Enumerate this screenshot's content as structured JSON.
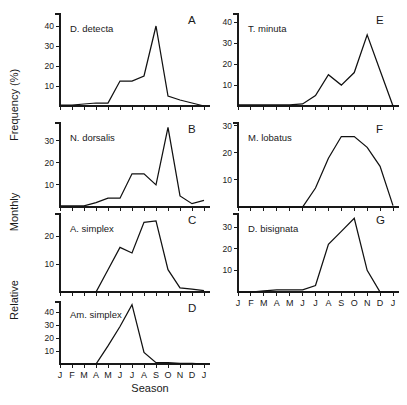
{
  "figure": {
    "xlabel": "Season",
    "ylabel": "Relative Monthly Frequency (%)",
    "ylabel_words": [
      "Relative",
      "Monthly",
      "Frequency (%)"
    ],
    "months": [
      "J",
      "F",
      "M",
      "A",
      "M",
      "J",
      "J",
      "A",
      "S",
      "O",
      "N",
      "D",
      "J"
    ],
    "month_axis_shown_on": [
      "D",
      "G"
    ]
  },
  "chart_data": [
    {
      "type": "line",
      "panel": "A",
      "title": "D. detecta",
      "xlabel": "",
      "ylabel": "",
      "categories": [
        "J",
        "F",
        "M",
        "A",
        "M",
        "J",
        "J",
        "A",
        "S",
        "O",
        "N",
        "D",
        "J"
      ],
      "values": [
        0.5,
        0.5,
        1,
        1.5,
        1.5,
        12.5,
        12.5,
        15,
        40,
        5,
        3,
        1.5,
        0
      ],
      "yticks": [
        10,
        20,
        30,
        40
      ],
      "ylim": [
        0,
        46
      ],
      "grid": false,
      "legend": false
    },
    {
      "type": "line",
      "panel": "B",
      "title": "N. dorsalis",
      "xlabel": "",
      "ylabel": "",
      "categories": [
        "J",
        "F",
        "M",
        "A",
        "M",
        "J",
        "J",
        "A",
        "S",
        "O",
        "N",
        "D",
        "J"
      ],
      "values": [
        0.5,
        0.5,
        0.5,
        2,
        4,
        4,
        15,
        15,
        10,
        36,
        5,
        1.5,
        3
      ],
      "yticks": [
        10,
        20,
        30
      ],
      "ylim": [
        0,
        38
      ],
      "grid": false,
      "legend": false
    },
    {
      "type": "line",
      "panel": "C",
      "title": "A. simplex",
      "xlabel": "",
      "ylabel": "",
      "categories": [
        "J",
        "F",
        "M",
        "A",
        "M",
        "J",
        "J",
        "A",
        "S",
        "O",
        "N",
        "D",
        "J"
      ],
      "values": [
        0,
        0,
        0,
        0,
        8,
        16,
        14,
        25,
        25.5,
        8,
        1.5,
        1,
        0.5
      ],
      "yticks": [
        10,
        20
      ],
      "ylim": [
        0,
        28
      ],
      "grid": false,
      "legend": false
    },
    {
      "type": "line",
      "panel": "D",
      "title": "Am. simplex",
      "xlabel": "Season",
      "ylabel": "",
      "categories": [
        "J",
        "F",
        "M",
        "A",
        "M",
        "J",
        "J",
        "A",
        "S",
        "O",
        "N",
        "D",
        "J"
      ],
      "values": [
        0,
        0,
        0,
        0,
        14,
        29,
        46,
        9,
        1,
        1,
        0.5,
        0.5,
        0
      ],
      "yticks": [
        10,
        20,
        30,
        40
      ],
      "ylim": [
        0,
        48
      ],
      "grid": false,
      "legend": false
    },
    {
      "type": "line",
      "panel": "E",
      "title": "T. minuta",
      "xlabel": "",
      "ylabel": "",
      "categories": [
        "J",
        "F",
        "M",
        "A",
        "M",
        "J",
        "J",
        "A",
        "S",
        "O",
        "N",
        "D",
        "J"
      ],
      "values": [
        0.5,
        0.5,
        0.5,
        0.5,
        0.5,
        1,
        5,
        15,
        10,
        16,
        34,
        17,
        0
      ],
      "yticks": [
        10,
        20,
        30,
        40
      ],
      "ylim": [
        0,
        44
      ],
      "grid": false,
      "legend": false
    },
    {
      "type": "line",
      "panel": "F",
      "title": "M. lobatus",
      "xlabel": "",
      "ylabel": "",
      "categories": [
        "J",
        "F",
        "M",
        "A",
        "M",
        "J",
        "J",
        "A",
        "S",
        "O",
        "N",
        "D",
        "J"
      ],
      "values": [
        0,
        0,
        0,
        0,
        0,
        0,
        7,
        18,
        26,
        26,
        22,
        15,
        0.5
      ],
      "yticks": [
        10,
        20,
        30
      ],
      "ylim": [
        0,
        31
      ],
      "grid": false,
      "legend": false
    },
    {
      "type": "line",
      "panel": "G",
      "title": "D. bisignata",
      "xlabel": "Season",
      "ylabel": "",
      "categories": [
        "J",
        "F",
        "M",
        "A",
        "M",
        "J",
        "J",
        "A",
        "S",
        "O",
        "N",
        "D",
        "J"
      ],
      "values": [
        0,
        0,
        0.5,
        1,
        1,
        1,
        3,
        22,
        28,
        34,
        10,
        0,
        0
      ],
      "yticks": [
        10,
        20,
        30
      ],
      "ylim": [
        0,
        36
      ],
      "grid": false,
      "legend": false
    }
  ]
}
